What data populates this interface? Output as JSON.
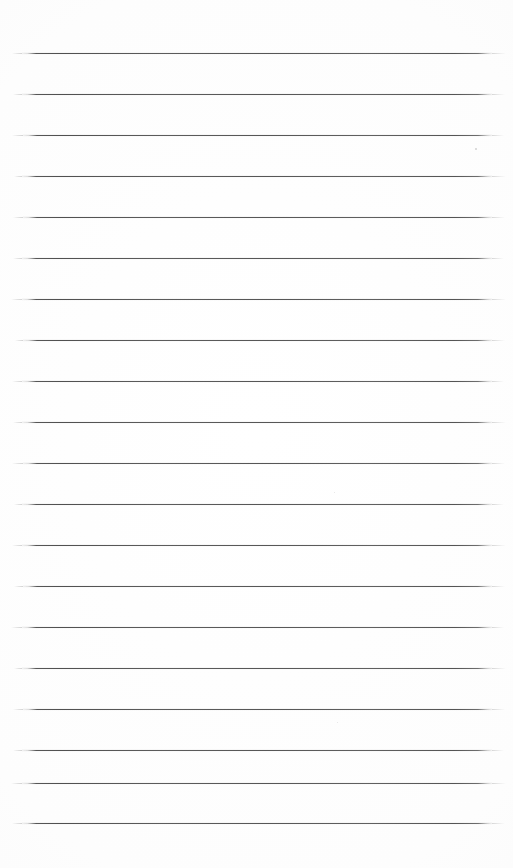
{
  "document": {
    "kind": "scanned-lined-paper",
    "title": "Blank ruled notepad page",
    "page_width": 513,
    "page_height": 868,
    "background_color": "#ffffff",
    "text_content": "",
    "visible_text": []
  },
  "ruling": {
    "line_color": "#5c5c5c",
    "line_thickness_px": 1.2,
    "line_count": 20,
    "left_x": 22,
    "right_x": 492,
    "line_length": 470,
    "first_line_y": 53,
    "last_line_y": 823,
    "average_spacing_px": 40.5,
    "lines": [
      {
        "y": 53,
        "left": 22,
        "right": 492,
        "tail_left": 10,
        "tail_right": 14
      },
      {
        "y": 94,
        "left": 22,
        "right": 492,
        "tail_left": 9,
        "tail_right": 13
      },
      {
        "y": 135,
        "left": 23,
        "right": 492,
        "tail_left": 11,
        "tail_right": 12
      },
      {
        "y": 176,
        "left": 22,
        "right": 492,
        "tail_left": 8,
        "tail_right": 14
      },
      {
        "y": 217,
        "left": 23,
        "right": 492,
        "tail_left": 10,
        "tail_right": 13
      },
      {
        "y": 258,
        "left": 22,
        "right": 492,
        "tail_left": 9,
        "tail_right": 12
      },
      {
        "y": 299,
        "left": 22,
        "right": 492,
        "tail_left": 11,
        "tail_right": 14
      },
      {
        "y": 340,
        "left": 23,
        "right": 492,
        "tail_left": 8,
        "tail_right": 13
      },
      {
        "y": 381,
        "left": 22,
        "right": 492,
        "tail_left": 10,
        "tail_right": 12
      },
      {
        "y": 422,
        "left": 22,
        "right": 492,
        "tail_left": 9,
        "tail_right": 14
      },
      {
        "y": 463,
        "left": 23,
        "right": 492,
        "tail_left": 11,
        "tail_right": 13
      },
      {
        "y": 504,
        "left": 22,
        "right": 492,
        "tail_left": 8,
        "tail_right": 12
      },
      {
        "y": 545,
        "left": 22,
        "right": 492,
        "tail_left": 10,
        "tail_right": 14
      },
      {
        "y": 586,
        "left": 23,
        "right": 492,
        "tail_left": 9,
        "tail_right": 13
      },
      {
        "y": 627,
        "left": 22,
        "right": 492,
        "tail_left": 11,
        "tail_right": 12
      },
      {
        "y": 668,
        "left": 22,
        "right": 492,
        "tail_left": 8,
        "tail_right": 14
      },
      {
        "y": 709,
        "left": 23,
        "right": 492,
        "tail_left": 10,
        "tail_right": 13
      },
      {
        "y": 750,
        "left": 22,
        "right": 492,
        "tail_left": 9,
        "tail_right": 12
      },
      {
        "y": 783,
        "left": 22,
        "right": 492,
        "tail_left": 11,
        "tail_right": 14
      },
      {
        "y": 823,
        "left": 22,
        "right": 492,
        "tail_left": 10,
        "tail_right": 13
      }
    ]
  },
  "artifacts": {
    "specks": [
      {
        "x": 475,
        "y": 148,
        "size": 2,
        "color": "#b2b2b2"
      },
      {
        "x": 334,
        "y": 492,
        "size": 1,
        "color": "#cfcfcf"
      },
      {
        "x": 337,
        "y": 722,
        "size": 1,
        "color": "#d2d2d2"
      }
    ]
  },
  "margins": {
    "top_blank_px": 53,
    "bottom_blank_px": 45,
    "left_blank_px": 22,
    "right_blank_px": 21
  }
}
